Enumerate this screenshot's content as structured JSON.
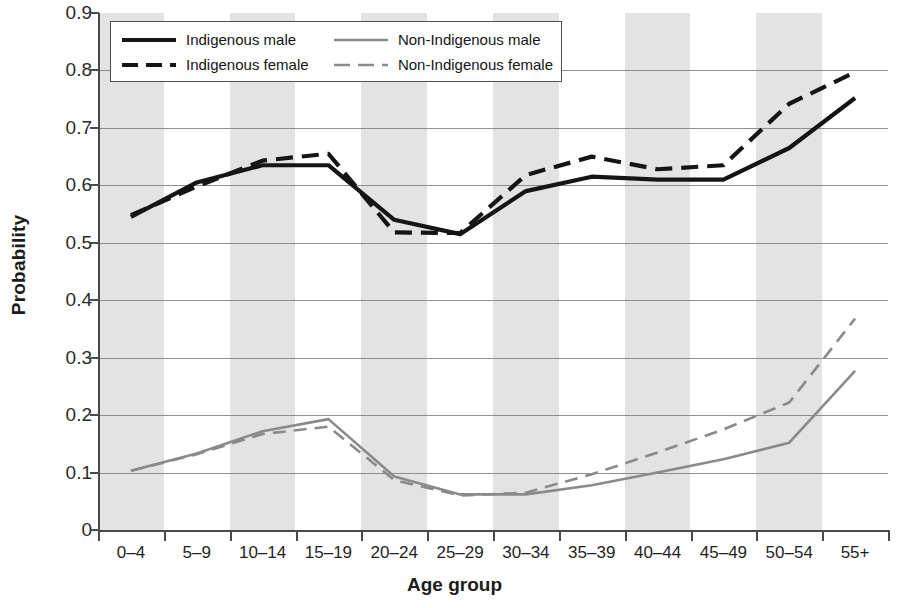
{
  "chart_data": {
    "type": "line",
    "title": "",
    "xlabel": "Age group",
    "ylabel": "Probability",
    "categories": [
      "0–4",
      "5–9",
      "10–14",
      "15–19",
      "20–24",
      "25–29",
      "30–34",
      "35–39",
      "40–44",
      "45–49",
      "50–54",
      "55+"
    ],
    "ylim": [
      0,
      0.9
    ],
    "ytick_labels": [
      "0.9",
      "0.8",
      "0.7",
      "0.6",
      "0.5",
      "0.4",
      "0.3",
      "0.2",
      "0.1",
      "0"
    ],
    "ytick_values": [
      0.9,
      0.8,
      0.7,
      0.6,
      0.5,
      0.4,
      0.3,
      0.2,
      0.1,
      0
    ],
    "grid": true,
    "legend_position": "top-left-inside",
    "series": [
      {
        "name": "Indigenous male",
        "color": "#151515",
        "style": "solid",
        "values": [
          0.545,
          0.605,
          0.635,
          0.635,
          0.54,
          0.515,
          0.59,
          0.615,
          0.61,
          0.61,
          0.665,
          0.752
        ]
      },
      {
        "name": "Indigenous female",
        "color": "#151515",
        "style": "dashed",
        "values": [
          0.548,
          0.598,
          0.643,
          0.655,
          0.518,
          0.517,
          0.618,
          0.65,
          0.628,
          0.635,
          0.742,
          0.797
        ]
      },
      {
        "name": "Non-Indigenous male",
        "color": "#8a8a8a",
        "style": "solid",
        "values": [
          0.103,
          0.133,
          0.172,
          0.193,
          0.093,
          0.062,
          0.062,
          0.078,
          0.1,
          0.123,
          0.152,
          0.277
        ]
      },
      {
        "name": "Non-Indigenous female",
        "color": "#8a8a8a",
        "style": "dashed",
        "values": [
          0.103,
          0.132,
          0.167,
          0.18,
          0.087,
          0.06,
          0.065,
          0.097,
          0.135,
          0.175,
          0.222,
          0.368
        ]
      }
    ]
  },
  "legend": {
    "items": [
      {
        "label": "Indigenous male",
        "swatch": "solid-black-line-icon"
      },
      {
        "label": "Indigenous female",
        "swatch": "dashed-black-line-icon"
      },
      {
        "label": "Non-Indigenous male",
        "swatch": "solid-gray-line-icon"
      },
      {
        "label": "Non-Indigenous female",
        "swatch": "dashed-gray-line-icon"
      }
    ]
  },
  "colors": {
    "indigenous": "#151515",
    "non_indigenous": "#8a8a8a",
    "band": "#e3e3e3",
    "gridline": "#8d8d8d",
    "axis": "#4a4a4a"
  }
}
